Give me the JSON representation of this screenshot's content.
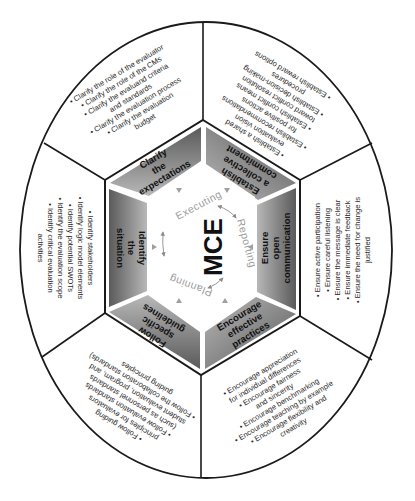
{
  "core": {
    "label": "MCE",
    "cycle": [
      "Executing",
      "Reporting",
      "Planning"
    ]
  },
  "colors": {
    "segment_dark": "#5e5e5e",
    "segment_light": "#bdbdbd",
    "outline": "#1a1a1a",
    "cycle_text": "#9a9a9a",
    "arrow": "#8a8a8a",
    "background": "#ffffff"
  },
  "segments": [
    {
      "id": "clarify",
      "label_lines": [
        "Clarify",
        "the",
        "expectations"
      ],
      "bullets": [
        "• Clarify the role of the evaluator",
        "• Clarify the role of the CMs",
        "• Clarify the evaluand criteria",
        "and standards",
        "• Clarify the evaluation process",
        "• Clarify the evaluation",
        "budget"
      ]
    },
    {
      "id": "commitment",
      "label_lines": [
        "Establish",
        "a collective",
        "commitment"
      ],
      "bullets": [
        "• Establish a shared",
        "evaluation vision",
        "• Establish recommendations",
        "for positive actions",
        "• Establish conflict means",
        "toward conflict resolution",
        "• Establish decision-making",
        "procedures",
        "• Establish reward options"
      ]
    },
    {
      "id": "communication",
      "label_lines": [
        "Ensure",
        "open",
        "communication"
      ],
      "bullets": [
        "• Ensure active participation",
        "• Ensure careful listening",
        "• Ensure the message is clear",
        "• Ensure immediate feedback",
        "• Ensure the need for change is",
        "justified"
      ]
    },
    {
      "id": "practices",
      "label_lines": [
        "Encourage",
        "effective",
        "practices"
      ],
      "bullets": [
        "• Encourage appreciation",
        "for individual differences",
        "• Encourage fairness",
        "and  sincerity",
        "• Encourage benchmarking",
        "• Encourage teaching by example",
        "• Encourage flexibility and",
        "creativity"
      ]
    },
    {
      "id": "guidelines",
      "label_lines": [
        "Follow",
        "specific",
        "guidelines"
      ],
      "bullets": [
        "• Follow guiding",
        "principles for evaluators",
        "• Follow evaluation standards",
        "(such as personnel standards",
        "student evaluation, program, and",
        "• Follow the collaboration standards)",
        "guiding principles"
      ]
    },
    {
      "id": "situation",
      "label_lines": [
        "Identify",
        "the",
        "situation"
      ],
      "bullets": [
        "• Identify stakeholders",
        "• Identify logic model elements",
        "• Identify potential SWOTs",
        "• Identify the evaluation scope",
        "• Identify critical evaluation",
        "activities"
      ]
    }
  ]
}
